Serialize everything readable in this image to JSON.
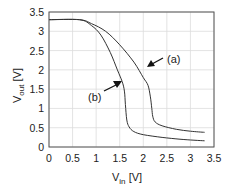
{
  "chart_data": {
    "type": "line",
    "title": "",
    "xlabel": "V_in [V]",
    "ylabel": "V_out [V]",
    "xlabel_main": "V",
    "xlabel_sub": "in",
    "xlabel_unit": " [V]",
    "ylabel_main": "V",
    "ylabel_sub": "out",
    "ylabel_unit": " [V]",
    "xlim": [
      0,
      3.5
    ],
    "ylim": [
      0,
      3.5
    ],
    "grid": true,
    "legend": "none (curves labeled with arrow annotations)",
    "x_ticks": [
      "0",
      "0.5",
      "1",
      "1.5",
      "2",
      "2.5",
      "3",
      "3.5"
    ],
    "y_ticks": [
      "0",
      "0.5",
      "1",
      "1.5",
      "2",
      "2.5",
      "3",
      "3.5"
    ],
    "series": [
      {
        "name": "(a)",
        "x": [
          0,
          0.65,
          0.9,
          1.2,
          1.5,
          1.8,
          2.0,
          2.1,
          2.15,
          2.18,
          2.2,
          2.25,
          2.4,
          2.7,
          3.0,
          3.3
        ],
        "y": [
          3.3,
          3.3,
          3.2,
          3.0,
          2.65,
          2.2,
          1.8,
          1.6,
          1.3,
          1.0,
          0.8,
          0.65,
          0.55,
          0.46,
          0.41,
          0.38
        ]
      },
      {
        "name": "(b)",
        "x": [
          0,
          0.65,
          0.9,
          1.1,
          1.3,
          1.45,
          1.55,
          1.6,
          1.62,
          1.65,
          1.7,
          1.8,
          2.0,
          2.4,
          2.8,
          3.3
        ],
        "y": [
          3.3,
          3.3,
          3.15,
          2.9,
          2.45,
          2.0,
          1.7,
          1.45,
          1.1,
          0.7,
          0.52,
          0.4,
          0.32,
          0.25,
          0.2,
          0.16
        ]
      }
    ],
    "annotations": [
      {
        "text": "(a)",
        "arrow_to": [
          2.1,
          1.85
        ]
      },
      {
        "text": "(b)",
        "arrow_to": [
          1.58,
          1.7
        ]
      }
    ]
  }
}
